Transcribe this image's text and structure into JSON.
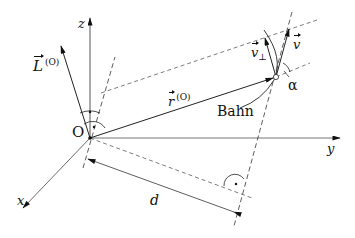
{
  "diagram": {
    "type": "vector-geometry",
    "axes": {
      "z_label": "z",
      "y_label": "y",
      "x_label": "x"
    },
    "origin_label": "O",
    "vectors": {
      "angular_momentum": {
        "symbol": "L",
        "superscript": "(O)"
      },
      "position": {
        "symbol": "r",
        "superscript": "(O)"
      },
      "velocity": {
        "symbol": "v"
      },
      "velocity_perpendicular": {
        "symbol": "v",
        "subscript": "⊥"
      }
    },
    "labels": {
      "trajectory": "Bahn",
      "angle": "α",
      "distance": "d"
    },
    "colors": {
      "line": "#222222",
      "axis": "#555555",
      "background": "#ffffff"
    }
  }
}
